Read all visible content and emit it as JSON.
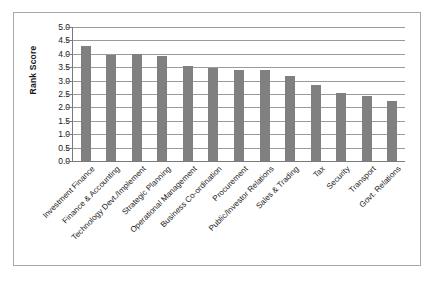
{
  "chart_data": {
    "type": "bar",
    "title": "",
    "xlabel": "",
    "ylabel": "Rank Score",
    "ylim": [
      0.0,
      5.0
    ],
    "ytick_labels": [
      "5.0",
      "4.5",
      "4.0",
      "3.5",
      "3.0",
      "2.5",
      "2.0",
      "1.5",
      "1.0",
      "0.5",
      "0.0"
    ],
    "ytick_values": [
      5.0,
      4.5,
      4.0,
      3.5,
      3.0,
      2.5,
      2.0,
      1.5,
      1.0,
      0.5,
      0.0
    ],
    "grid": "horizontal",
    "legend": "none",
    "bar_color": "#808080",
    "categories": [
      "Investment Finance",
      "Finance & Accounting",
      "Technology Devt./Implement",
      "Strategic Planning",
      "Operational Management",
      "Business Co-ordination",
      "Procurement",
      "Public/Investor Relations",
      "Sales & Trading",
      "Tax",
      "Security",
      "Transport",
      "Govt. Relations"
    ],
    "values": [
      4.3,
      3.95,
      3.98,
      3.93,
      3.55,
      3.48,
      3.4,
      3.4,
      3.17,
      2.85,
      2.55,
      2.42,
      2.25
    ]
  }
}
